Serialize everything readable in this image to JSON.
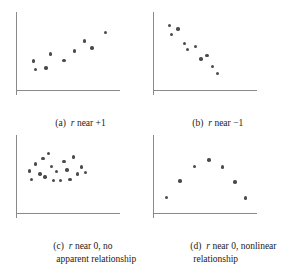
{
  "figure": {
    "kind": "scatterplot-grid",
    "background": "#ffffff",
    "axis_color": "#8a8a8a",
    "dot_color": "#4a4a4f"
  },
  "chart_data": [
    {
      "type": "scatter",
      "panel": "a",
      "tag": "(a)",
      "caption_line1_pre": "r",
      "caption_line1_post": " near +1",
      "caption_line2": "",
      "title": "r near +1",
      "xlabel": "",
      "ylabel": "",
      "xlim": [
        0,
        10
      ],
      "ylim": [
        0,
        10
      ],
      "grid": false,
      "legend": "none",
      "x": [
        1.7,
        1.9,
        2.9,
        3.3,
        4.6,
        5.6,
        6.6,
        7.3,
        8.6
      ],
      "y": [
        3.7,
        2.6,
        2.8,
        4.6,
        3.8,
        5.0,
        6.3,
        5.4,
        7.4
      ]
    },
    {
      "type": "scatter",
      "panel": "b",
      "tag": "(b)",
      "caption_line1_pre": "r",
      "caption_line1_post": " near −1",
      "caption_line2": "",
      "title": "r near -1",
      "xlabel": "",
      "ylabel": "",
      "xlim": [
        0,
        10
      ],
      "ylim": [
        0,
        10
      ],
      "grid": false,
      "legend": "none",
      "x": [
        1.6,
        1.8,
        2.4,
        3.0,
        3.3,
        4.1,
        4.6,
        5.2,
        5.7,
        6.2
      ],
      "y": [
        8.3,
        7.1,
        7.8,
        6.0,
        5.2,
        5.6,
        4.0,
        4.4,
        3.0,
        2.1
      ]
    },
    {
      "type": "scatter",
      "panel": "c",
      "tag": "(c)",
      "caption_line1_pre": "r",
      "caption_line1_post": " near 0, no",
      "caption_line2": "apparent relationship",
      "title": "r near 0, no apparent relationship",
      "xlabel": "",
      "ylabel": "",
      "xlim": [
        0,
        10
      ],
      "ylim": [
        0,
        10
      ],
      "grid": false,
      "legend": "none",
      "x": [
        1.3,
        1.5,
        1.9,
        2.3,
        2.6,
        2.8,
        3.1,
        3.4,
        3.6,
        3.9,
        4.3,
        4.6,
        4.9,
        5.2,
        5.5,
        5.9,
        6.3,
        6.7
      ],
      "y": [
        5.4,
        4.3,
        6.3,
        5.0,
        7.0,
        4.6,
        7.6,
        6.0,
        4.2,
        5.3,
        4.2,
        6.6,
        5.5,
        4.3,
        7.2,
        5.0,
        5.9,
        5.2
      ]
    },
    {
      "type": "scatter",
      "panel": "d",
      "tag": "(d)",
      "caption_line1_pre": "r",
      "caption_line1_post": " near 0, nonlinear",
      "caption_line2": "relationship",
      "title": "r near 0, nonlinear relationship",
      "xlabel": "",
      "ylabel": "",
      "xlim": [
        0,
        10
      ],
      "ylim": [
        0,
        10
      ],
      "grid": false,
      "legend": "none",
      "x": [
        1.3,
        2.6,
        4.0,
        5.4,
        6.7,
        7.9,
        8.9
      ],
      "y": [
        2.0,
        4.1,
        6.0,
        6.8,
        5.9,
        4.0,
        1.9
      ]
    }
  ]
}
